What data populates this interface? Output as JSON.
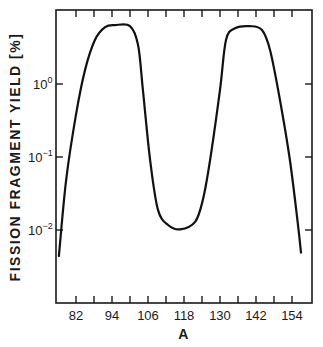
{
  "chart_data": {
    "type": "line",
    "title": "",
    "xlabel": "A",
    "ylabel": "FISSION FRAGMENT YIELD [%]",
    "yscale": "log",
    "xlim": [
      75.3,
      160.7
    ],
    "ylim": [
      0.001,
      10.3
    ],
    "grid": false,
    "legend": null,
    "x_ticks": [
      82,
      94,
      106,
      118,
      130,
      142,
      154
    ],
    "x_minor_ticks": [
      88,
      100,
      112,
      124,
      136,
      148
    ],
    "y_ticks": [
      1,
      0.1,
      0.01
    ],
    "y_tick_labels": [
      "10⁰",
      "10⁻¹",
      "10⁻²"
    ],
    "series": [
      {
        "name": "mass yield",
        "color": "#111111",
        "x": [
          76.3,
          78.7,
          82,
          85,
          88.3,
          91.7,
          95,
          100,
          102.7,
          104.3,
          106.7,
          109.3,
          112.7,
          116.7,
          121.7,
          124.3,
          126.7,
          130,
          132,
          135,
          140,
          144,
          146.7,
          150,
          153.3,
          156,
          157
        ],
        "y": [
          0.0044,
          0.048,
          0.38,
          1.55,
          4.0,
          6.0,
          6.4,
          6.2,
          3.4,
          0.83,
          0.091,
          0.019,
          0.0117,
          0.0102,
          0.0129,
          0.026,
          0.091,
          0.83,
          4.0,
          5.8,
          6.2,
          5.5,
          2.9,
          0.6,
          0.091,
          0.0117,
          0.0049
        ]
      }
    ]
  },
  "axes": {
    "x_title": "A",
    "y_title": "FISSION FRAGMENT YIELD [%]",
    "x_tick_labels": [
      "82",
      "94",
      "106",
      "118",
      "130",
      "142",
      "154"
    ],
    "y_tick_labels": [
      {
        "base": "10",
        "exp": "0"
      },
      {
        "base": "10",
        "exp": "−1"
      },
      {
        "base": "10",
        "exp": "−2"
      }
    ]
  }
}
